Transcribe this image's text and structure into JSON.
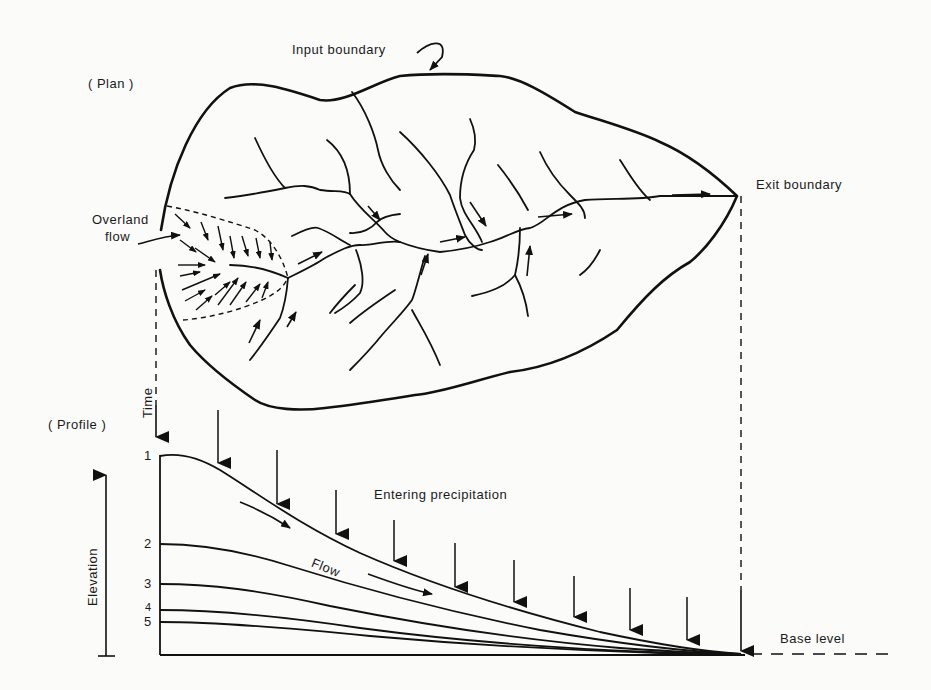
{
  "figure": {
    "plan": {
      "section_label": "( Plan )",
      "input_boundary_label": "Input boundary",
      "exit_boundary_label": "Exit boundary",
      "overland_flow_label_line1": "Overland",
      "overland_flow_label_line2": "flow"
    },
    "profile": {
      "section_label": "( Profile )",
      "time_label": "Time",
      "elevation_label": "Elevation",
      "entering_precipitation_label": "Entering precipitation",
      "flow_label": "Flow",
      "base_level_label": "Base level",
      "stage_labels": [
        "1",
        "2",
        "3",
        "4",
        "5"
      ]
    },
    "colors": {
      "ink": "#111111",
      "paper": "#fbfbfa"
    }
  }
}
